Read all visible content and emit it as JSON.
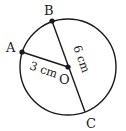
{
  "diagram": {
    "type": "circle-geometry",
    "circle": {
      "center_label": "O",
      "cx": 68,
      "cy": 67,
      "r": 48,
      "stroke": "#1a1a1a"
    },
    "points": [
      {
        "label": "A",
        "x": 22,
        "y": 52,
        "label_x": 6,
        "label_y": 51
      },
      {
        "label": "B",
        "x": 52,
        "y": 21,
        "label_x": 44,
        "label_y": 14
      },
      {
        "label": "O",
        "x": 68,
        "y": 67,
        "label_x": 59,
        "label_y": 84
      },
      {
        "label": "C",
        "x": 85,
        "y": 112,
        "label_x": 86,
        "label_y": 127
      }
    ],
    "segments": [
      {
        "from": "A",
        "to": "O",
        "length_label": "3 cm",
        "meaning": "radius"
      },
      {
        "from": "B",
        "to": "C",
        "length_label": "6 cm",
        "meaning": "diameter"
      }
    ],
    "labels": {
      "A": "A",
      "B": "B",
      "O": "O",
      "C": "C",
      "radius": "3 cm",
      "diameter": "6 cm"
    }
  }
}
